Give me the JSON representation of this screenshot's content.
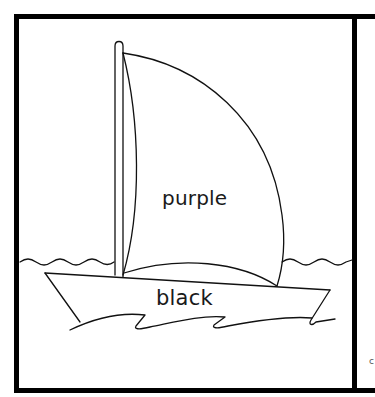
{
  "page": {
    "type": "coloring-page"
  },
  "labels": {
    "sail": "purple",
    "hull": "black"
  },
  "edge_text": "c",
  "colors": {
    "line": "#000000",
    "background": "#ffffff"
  }
}
